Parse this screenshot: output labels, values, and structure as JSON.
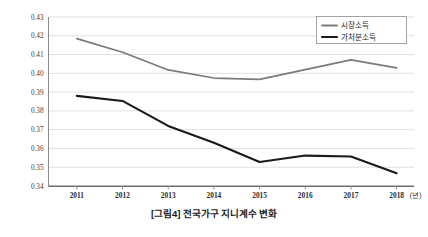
{
  "caption": "[그림4] 전국가구 지니계수 변화",
  "axis": {
    "x_unit_label": "(년)"
  },
  "legend": {
    "items": [
      {
        "label": "시장소득",
        "color": "#7b7b7b"
      },
      {
        "label": "가처분소득",
        "color": "#1a1a1a"
      }
    ]
  },
  "chart_data": {
    "type": "line",
    "title": "[그림4] 전국가구 지니계수 변화",
    "xlabel": "(년)",
    "ylabel": "",
    "categories": [
      "2011",
      "2012",
      "2013",
      "2014",
      "2015",
      "2016",
      "2017",
      "2018"
    ],
    "x": [
      2011,
      2012,
      2013,
      2014,
      2015,
      2016,
      2017,
      2018
    ],
    "ylim": [
      0.34,
      0.43
    ],
    "ytick_labels": [
      "0.34",
      "0.35",
      "0.36",
      "0.37",
      "0.38",
      "0.39",
      "0.40",
      "0.41",
      "0.42",
      "0.43"
    ],
    "ytick_values": [
      0.34,
      0.35,
      0.36,
      0.37,
      0.38,
      0.39,
      0.4,
      0.41,
      0.42,
      0.43
    ],
    "grid": true,
    "grid_axis": "y",
    "legend_position": "top-right",
    "series": [
      {
        "name": "시장소득",
        "color": "#7b7b7b",
        "values": [
          0.4185,
          0.4112,
          0.4018,
          0.3975,
          0.3968,
          0.402,
          0.4072,
          0.4029
        ]
      },
      {
        "name": "가처분소득",
        "color": "#1a1a1a",
        "values": [
          0.388,
          0.3853,
          0.372,
          0.363,
          0.3528,
          0.3562,
          0.3557,
          0.3468
        ]
      }
    ]
  }
}
